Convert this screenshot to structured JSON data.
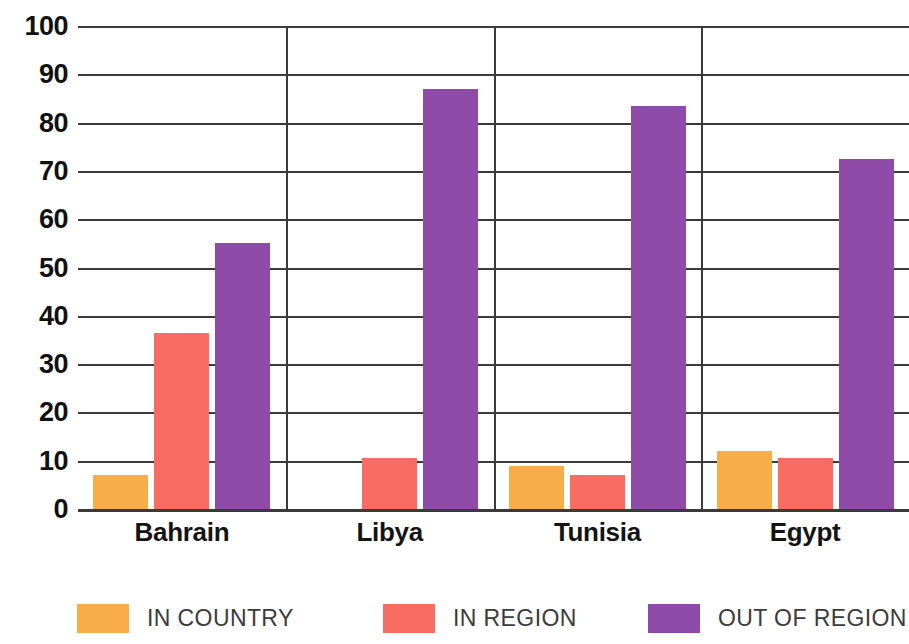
{
  "chart_data": {
    "type": "bar",
    "title": "",
    "subtitle": "",
    "xlabel": "",
    "ylabel": "",
    "ylim": [
      0,
      100
    ],
    "ytick_step": 10,
    "yticks": [
      100,
      90,
      80,
      70,
      60,
      50,
      40,
      30,
      20,
      10,
      0
    ],
    "grid": true,
    "legend_position": "bottom",
    "categories": [
      "Bahrain",
      "Libya",
      "Tunisia",
      "Egypt"
    ],
    "series": [
      {
        "name": "IN COUNTRY",
        "color": "#F7AE4A",
        "values": [
          7,
          null,
          9,
          12
        ]
      },
      {
        "name": "IN REGION",
        "color": "#F96C64",
        "values": [
          36.5,
          10.5,
          7,
          10.5
        ]
      },
      {
        "name": "OUT OF REGION",
        "color": "#8E4BA8",
        "values": [
          55,
          87,
          83.5,
          72.5
        ]
      }
    ]
  },
  "axis": {
    "y_tick_labels": [
      "100",
      "90",
      "80",
      "70",
      "60",
      "50",
      "40",
      "30",
      "20",
      "10",
      "0"
    ],
    "x_tick_labels": [
      "Bahrain",
      "Libya",
      "Tunisia",
      "Egypt"
    ]
  },
  "legend": {
    "items": [
      {
        "label": "IN COUNTRY",
        "color": "#F7AE4A"
      },
      {
        "label": "IN REGION",
        "color": "#F96C64"
      },
      {
        "label": "OUT OF REGION",
        "color": "#8E4BA8"
      }
    ]
  },
  "colors": {
    "in_country": "#F7AE4A",
    "in_region": "#F96C64",
    "out_of_region": "#8E4BA8",
    "gridline": "#3a3a3a",
    "text": "#111111",
    "legend_text": "#3b3b3b",
    "background": "#ffffff"
  }
}
